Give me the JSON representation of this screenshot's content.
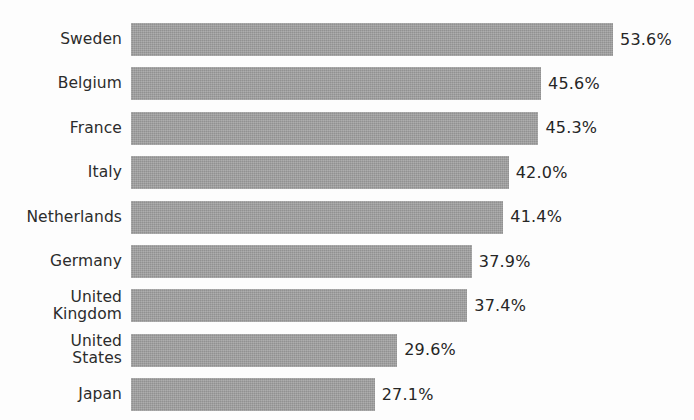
{
  "chart_data": {
    "type": "bar",
    "orientation": "horizontal",
    "title": "",
    "subtitle": "",
    "xlabel": "",
    "ylabel": "",
    "grid": false,
    "legend": null,
    "legend_position": "none",
    "axis_visible": false,
    "tick_labels_x": [],
    "xlim": [
      0,
      53.6
    ],
    "value_suffix": "%",
    "bar_color": "#9b9b9b",
    "background_color": "#fdfdfd",
    "text_color": "#2c2c2c",
    "categories": [
      "Sweden",
      "Belgium",
      "France",
      "Italy",
      "Netherlands",
      "Germany",
      "United\nKingdom",
      "United\nStates",
      "Japan"
    ],
    "values": [
      53.6,
      45.6,
      45.3,
      42.0,
      41.4,
      37.9,
      37.4,
      29.6,
      27.1
    ],
    "value_labels": [
      "53.6%",
      "45.6%",
      "45.3%",
      "42.0%",
      "41.4%",
      "37.9%",
      "37.4%",
      "29.6%",
      "27.1%"
    ],
    "bars": [
      {
        "category": "Sweden",
        "value": 53.6,
        "label": "53.6%"
      },
      {
        "category": "Belgium",
        "value": 45.6,
        "label": "45.6%"
      },
      {
        "category": "France",
        "value": 45.3,
        "label": "45.3%"
      },
      {
        "category": "Italy",
        "value": 42.0,
        "label": "42.0%"
      },
      {
        "category": "Netherlands",
        "value": 41.4,
        "label": "41.4%"
      },
      {
        "category": "Germany",
        "value": 37.9,
        "label": "37.9%"
      },
      {
        "category": "United Kingdom",
        "value": 37.4,
        "label": "37.4%"
      },
      {
        "category": "United States",
        "value": 29.6,
        "label": "29.6%"
      },
      {
        "category": "Japan",
        "value": 27.1,
        "label": "27.1%"
      }
    ]
  },
  "layout": {
    "label_column_width": 122,
    "bar_origin_x": 131,
    "px_per_unit": 8.993,
    "row_pitch": 44.4,
    "first_row_top": 23,
    "bar_height": 33
  }
}
